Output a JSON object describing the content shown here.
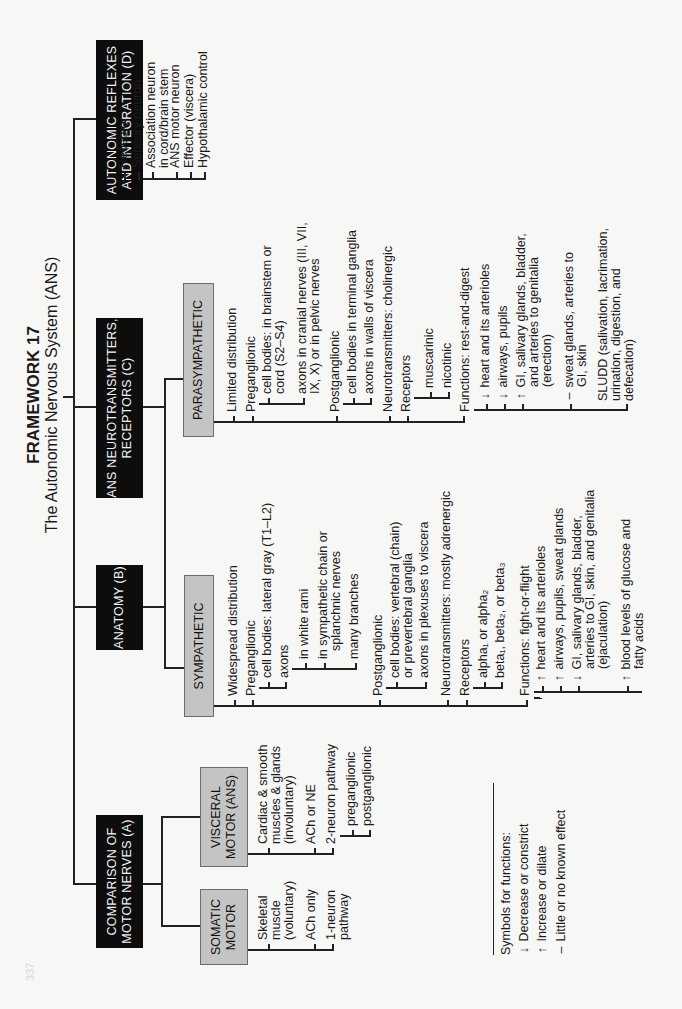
{
  "header": {
    "title": "FRAMEWORK 17",
    "subtitle": "The Autonomic Nervous System (ANS)"
  },
  "sections": {
    "a": {
      "label_line1": "COMPARISON OF",
      "label_line2": "MOTOR NERVES (A)"
    },
    "b": {
      "label_line1": "ANATOMY (B)"
    },
    "c": {
      "label_line1": "ANS NEUROTRANSMITTERS,",
      "label_line2": "RECEPTORS (C)"
    },
    "d": {
      "label_line1": "AUTONOMIC REFLEXES",
      "label_line2": "AND INTEGRATION (D)"
    }
  },
  "reflexes": {
    "items": [
      "Receptor",
      "Sensory neuron",
      "Association neuron",
      "in cord/brain stem",
      "ANS motor neuron",
      "Effector (viscera)",
      "Hypothalamic control"
    ]
  },
  "somatic": {
    "label_line1": "SOMATIC",
    "label_line2": "MOTOR",
    "items": [
      "Skeletal",
      "muscle",
      "(voluntary)",
      "ACh only",
      "1-neuron",
      "pathway"
    ]
  },
  "visceral": {
    "label_line1": "VISCERAL",
    "label_line2": "MOTOR (ANS)",
    "items": [
      "Cardiac  & smooth",
      "muscles & glands",
      "(involuntary)",
      "ACh or NE",
      "2-neuron pathway",
      "preganglionic",
      "postganglionic"
    ]
  },
  "sympathetic": {
    "label": "SYMPATHETIC",
    "distribution": "Widespread distribution",
    "preganglionic": "Preganglionic",
    "pre_cell_bodies": "cell bodies: lateral gray (T1–L2)",
    "pre_axons": "axons",
    "axons_white_rami": "in white rami",
    "axons_chain_1": "in sympathetic chain or",
    "axons_chain_2": "splanchnic nerves",
    "axons_branches": "many branches",
    "postganglionic": "Postganglionic",
    "post_cell_bodies_1": "cell bodies: vertebral (chain)",
    "post_cell_bodies_2": "or prevertebral ganglia",
    "post_axons": "axons in plexuses to viscera",
    "neurotransmitters": "Neurotransmitters: mostly adrenergic",
    "receptors": "Receptors",
    "receptor_alpha": "alpha₁ or alpha₂",
    "receptor_beta": "beta₁, beta₂, or beta₃",
    "functions": "Functions: fight-or-flight",
    "f1_sym": "↑",
    "f1": "heart and its arterioles",
    "f2_sym": "↑",
    "f2": "airways, pupils, sweat glands",
    "f3_sym": "↓",
    "f3_1": "GI, salivary glands, bladder,",
    "f3_2": "arteries to GI, skin, and genitalia",
    "f3_3": "(ejaculation)",
    "f4_sym": "↑",
    "f4_1": "blood levels of glucose and",
    "f4_2": "fatty acids"
  },
  "parasympathetic": {
    "label": "PARASYMPATHETIC",
    "distribution": "Limited distribution",
    "preganglionic": "Preganglionic",
    "pre_cell_bodies_1": "cell bodies: in brainstem or",
    "pre_cell_bodies_2": "cord (S2–S4)",
    "pre_axons_1": "axons in cranial nerves (III, VII,",
    "pre_axons_2": "IX, X) or in pelvic nerves",
    "postganglionic": "Postganglionic",
    "post_cell_bodies": "cell bodies in terminal ganglia",
    "post_axons": "axons in walls of viscera",
    "neurotransmitters": "Neurotransmitters: cholinergic",
    "receptors": "Receptors",
    "receptor_muscarinic": "muscarinic",
    "receptor_nicotinic": "nicotinic",
    "functions": "Functions: rest-and-digest",
    "f1_sym": "↓",
    "f1": "heart and its arterioles",
    "f2_sym": "↓",
    "f2": "airways, pupils",
    "f3_sym": "↑",
    "f3_1": "GI, salivary glands, bladder,",
    "f3_2": "and arteries to genitalia",
    "f3_3": "(erection)",
    "f4_sym": "–",
    "f4_1": "sweat glands, arteries to",
    "f4_2": "GI, skin",
    "f5_1": "SLUDD (salivation, lacrimation,",
    "f5_2": "urination, digestion, and",
    "f5_3": "defecation)"
  },
  "legend": {
    "title": "Symbols for functions:",
    "items": [
      {
        "symbol": "↓",
        "label": "Decrease or constrict"
      },
      {
        "symbol": "↑",
        "label": "Increase or dilate"
      },
      {
        "symbol": "–",
        "label": "Little or no known effect"
      }
    ]
  },
  "page_number": "337",
  "colors": {
    "black_box": "#0d0d0d",
    "gray_box": "#c4c4c4",
    "background": "#f7f7f6"
  }
}
